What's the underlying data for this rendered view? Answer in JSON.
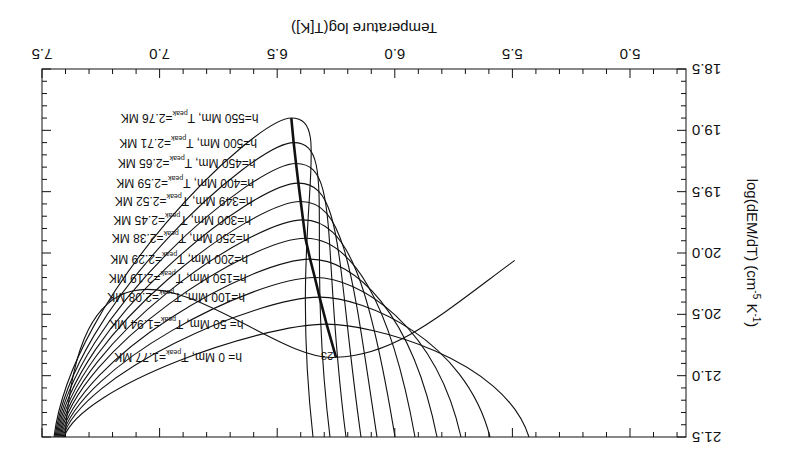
{
  "chart_data": {
    "type": "line",
    "orientation_note": "figure rendered rotated 180 degrees",
    "title": "",
    "xlabel": "Temperature  log(T[K])",
    "ylabel": "log(dEM/dT) (cm^-5 K^-1)",
    "xlim": [
      5.0,
      7.5
    ],
    "ylim": [
      18.5,
      21.5
    ],
    "x_ticks": [
      "5.0",
      "5.5",
      "6.0",
      "6.5",
      "7.0",
      "7.5"
    ],
    "y_ticks": [
      "18.5",
      "19.0",
      "19.5",
      "20.0",
      "20.5",
      "21.0",
      "21.5"
    ],
    "grid": false,
    "annotation": "23",
    "series": [
      {
        "name": "h=  0 Mm, T_peak=1.77 MK",
        "h_Mm": 0,
        "T_peak_MK": 1.77,
        "peak_logT": 6.25,
        "peak_logDEM": 20.85
      },
      {
        "name": "h= 50 Mm, T_peak=1.94 MK",
        "h_Mm": 50,
        "T_peak_MK": 1.94,
        "peak_logT": 6.29,
        "peak_logDEM": 20.58
      },
      {
        "name": "h=100 Mm, T_peak=2.08 MK",
        "h_Mm": 100,
        "T_peak_MK": 2.08,
        "peak_logT": 6.32,
        "peak_logDEM": 20.36
      },
      {
        "name": "h=150 Mm, T_peak=2.19 MK",
        "h_Mm": 150,
        "T_peak_MK": 2.19,
        "peak_logT": 6.34,
        "peak_logDEM": 20.2
      },
      {
        "name": "h=200 Mm, T_peak=2.29 MK",
        "h_Mm": 200,
        "T_peak_MK": 2.29,
        "peak_logT": 6.36,
        "peak_logDEM": 20.05
      },
      {
        "name": "h=250 Mm, T_peak=2.38 MK",
        "h_Mm": 250,
        "T_peak_MK": 2.38,
        "peak_logT": 6.38,
        "peak_logDEM": 19.88
      },
      {
        "name": "h=300 Mm, T_peak=2.45 MK",
        "h_Mm": 300,
        "T_peak_MK": 2.45,
        "peak_logT": 6.39,
        "peak_logDEM": 19.73
      },
      {
        "name": "h=349 Mm, T_peak=2.52 MK",
        "h_Mm": 349,
        "T_peak_MK": 2.52,
        "peak_logT": 6.4,
        "peak_logDEM": 19.58
      },
      {
        "name": "h=400 Mm, T_peak=2.59 MK",
        "h_Mm": 400,
        "T_peak_MK": 2.59,
        "peak_logT": 6.41,
        "peak_logDEM": 19.43
      },
      {
        "name": "h=450 Mm, T_peak=2.65 MK",
        "h_Mm": 450,
        "T_peak_MK": 2.65,
        "peak_logT": 6.42,
        "peak_logDEM": 19.27
      },
      {
        "name": "h=500 Mm, T_peak=2.71 MK",
        "h_Mm": 500,
        "T_peak_MK": 2.71,
        "peak_logT": 6.43,
        "peak_logDEM": 19.1
      },
      {
        "name": "h=550 Mm, T_peak=2.76 MK",
        "h_Mm": 550,
        "T_peak_MK": 2.76,
        "peak_logT": 6.44,
        "peak_logDEM": 18.9
      }
    ]
  },
  "labels": {
    "xlabel": "Temperature  log(T[K])",
    "ylabel_main": "log(dEM/dT) (cm",
    "ylabel_sup1": "-5",
    "ylabel_mid": " K",
    "ylabel_sup2": "-1",
    "ylabel_end": ")",
    "annotation": "23",
    "curve_labels": [
      {
        "pre": "h=  0 Mm, T",
        "sub": "peak",
        "post": "=1.77 MK"
      },
      {
        "pre": "h= 50 Mm, T",
        "sub": "peak",
        "post": "=1.94 MK"
      },
      {
        "pre": "h=100 Mm, T",
        "sub": "peak",
        "post": "=2.08 MK"
      },
      {
        "pre": "h=150 Mm, T",
        "sub": "peak",
        "post": "=2.19 MK"
      },
      {
        "pre": "h=200 Mm, T",
        "sub": "peak",
        "post": "=2.29 MK"
      },
      {
        "pre": "h=250 Mm, T",
        "sub": "peak",
        "post": "=2.38 MK"
      },
      {
        "pre": "h=300 Mm, T",
        "sub": "peak",
        "post": "=2.45 MK"
      },
      {
        "pre": "h=349 Mm, T",
        "sub": "peak",
        "post": "=2.52 MK"
      },
      {
        "pre": "h=400 Mm, T",
        "sub": "peak",
        "post": "=2.59 MK"
      },
      {
        "pre": "h=450 Mm, T",
        "sub": "peak",
        "post": "=2.65 MK"
      },
      {
        "pre": "h=500 Mm, T",
        "sub": "peak",
        "post": "=2.71 MK"
      },
      {
        "pre": "h=550 Mm, T",
        "sub": "peak",
        "post": "=2.76 MK"
      }
    ],
    "x_ticks": [
      "5.0",
      "5.5",
      "6.0",
      "6.5",
      "7.0",
      "7.5"
    ],
    "y_ticks": [
      "18.5",
      "19.0",
      "19.5",
      "20.0",
      "20.5",
      "21.0",
      "21.5"
    ]
  }
}
